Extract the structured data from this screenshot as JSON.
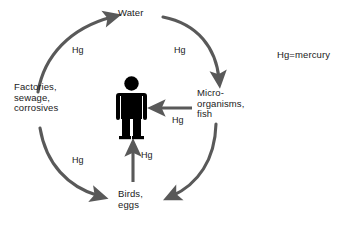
{
  "diagram": {
    "colors": {
      "arrow": "#595959",
      "figure": "#000000",
      "text": "#1a1a1a",
      "background": "#ffffff"
    },
    "nodes": [
      {
        "id": "water",
        "label": "Water",
        "position": "top"
      },
      {
        "id": "micro",
        "label": "Micro-\norganisms,\nfish",
        "position": "right"
      },
      {
        "id": "birds",
        "label": "Birds,\neggs",
        "position": "bottom"
      },
      {
        "id": "factories",
        "label": "Factories,\nsewage,\ncorrosives",
        "position": "left"
      },
      {
        "id": "human",
        "label": "",
        "position": "center"
      }
    ],
    "flow_labels": {
      "factories_to_water": "Hg",
      "water_to_micro": "Hg",
      "factories_to_birds": "Hg",
      "micro_to_human": "Hg",
      "birds_to_human": "Hg"
    },
    "legend": {
      "text": "Hg=mercury"
    }
  }
}
